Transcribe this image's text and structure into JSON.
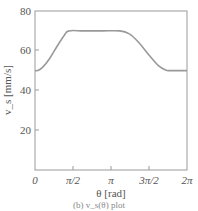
{
  "chart_data": {
    "type": "line",
    "title": "",
    "xlabel": "θ [rad]",
    "ylabel": "v_s [mm/s]",
    "xlim": [
      0,
      6.2832
    ],
    "ylim": [
      0,
      80
    ],
    "grid": false,
    "legend": null,
    "x_ticks": [
      "0",
      "π/2",
      "π",
      "3π/2",
      "2π"
    ],
    "y_ticks": [
      "20",
      "40",
      "60",
      "80"
    ],
    "series": [
      {
        "name": "v_s",
        "color": "#999999",
        "x": [
          0,
          0.1,
          0.3,
          0.6,
          0.9,
          1.2,
          1.4,
          2.0,
          2.8,
          3.5,
          3.9,
          4.3,
          4.7,
          5.1,
          5.4,
          5.6,
          6.2832
        ],
        "y": [
          50,
          50,
          51.5,
          56,
          62,
          67.5,
          70,
          70,
          70,
          70,
          68.5,
          64,
          58,
          52.5,
          50.3,
          50,
          50
        ]
      }
    ]
  },
  "caption": "(b) v_s(θ) plot"
}
